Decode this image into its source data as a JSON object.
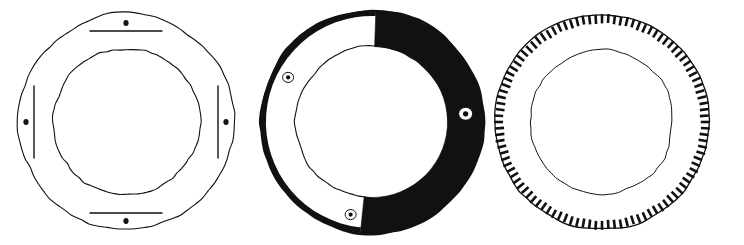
{
  "plate": {
    "title": "Three ring-shaped artefact drawings",
    "background_color": "#ffffff",
    "ink_color": "#111111",
    "width": 744,
    "height": 245
  },
  "figures": [
    {
      "id": "figure-1",
      "name": "open-ring-with-four-rivets",
      "label": "",
      "description": "Line-drawn annulus, unshaded, with four dot rivets and four short straight bar marks at top, bottom, left and right",
      "center": {
        "x": 126,
        "y": 122
      },
      "outer_radius": 108,
      "inner_radius": 73,
      "stroke_width": 1.1,
      "fill": "none",
      "markings": [
        {
          "name": "rivet-dot-top",
          "type": "dot",
          "angle_deg": 270,
          "radius": 99,
          "size": 5.0
        },
        {
          "name": "rivet-dot-bottom",
          "type": "dot",
          "angle_deg": 90,
          "radius": 99,
          "size": 5.0
        },
        {
          "name": "rivet-dot-left",
          "type": "dot",
          "angle_deg": 180,
          "radius": 100,
          "size": 5.0
        },
        {
          "name": "rivet-dot-right",
          "type": "dot",
          "angle_deg": 0,
          "radius": 100,
          "size": 5.0
        },
        {
          "name": "bar-mark-top",
          "type": "bar",
          "angle_deg": 270,
          "radius": 91,
          "length": 72
        },
        {
          "name": "bar-mark-bottom",
          "type": "bar",
          "angle_deg": 90,
          "radius": 91,
          "length": 72
        },
        {
          "name": "bar-mark-left",
          "type": "bar",
          "angle_deg": 180,
          "radius": 92,
          "length": 72
        },
        {
          "name": "bar-mark-right",
          "type": "bar",
          "angle_deg": 0,
          "radius": 92,
          "length": 72
        }
      ]
    },
    {
      "id": "figure-2",
      "name": "part-blackened-ring-with-three-perforations",
      "label": "",
      "description": "Annulus with a solid black band covering most of the circumference; an unshaded sector runs from the top round the left side to the bottom; three small white perforations pierce the band",
      "center": {
        "x": 372,
        "y": 122
      },
      "outer_radius": 111,
      "inner_radius": 76,
      "stroke_width": 1.1,
      "fill": "solid-black-sector",
      "black_sector": {
        "start_angle_deg": 272,
        "end_angle_deg": 96
      },
      "markings": [
        {
          "name": "perforation-upper-left",
          "type": "hole",
          "angle_deg": 208,
          "radius": 95,
          "size": 5.5
        },
        {
          "name": "perforation-right",
          "type": "hole",
          "angle_deg": 355,
          "radius": 94,
          "size": 7.0
        },
        {
          "name": "perforation-bottom",
          "type": "hole",
          "angle_deg": 103,
          "radius": 95,
          "size": 5.5
        }
      ]
    },
    {
      "id": "figure-3",
      "name": "ring-with-hatched-outer-rim",
      "label": "",
      "description": "Annulus whose outer rim carries a dense band of short radial hatch ticks, like comb teeth, all round the circumference; plain thin inner circle",
      "center": {
        "x": 602,
        "y": 122
      },
      "outer_radius": 107,
      "inner_radius": 72,
      "stroke_width": 1.0,
      "fill": "none",
      "hatch": {
        "name": "radial-tick-band",
        "tick_count": 104,
        "tick_length": 9,
        "tick_width": 2.6,
        "band_outer_radius": 107
      },
      "markings": []
    }
  ],
  "legend": {
    "visible": false,
    "items": []
  }
}
